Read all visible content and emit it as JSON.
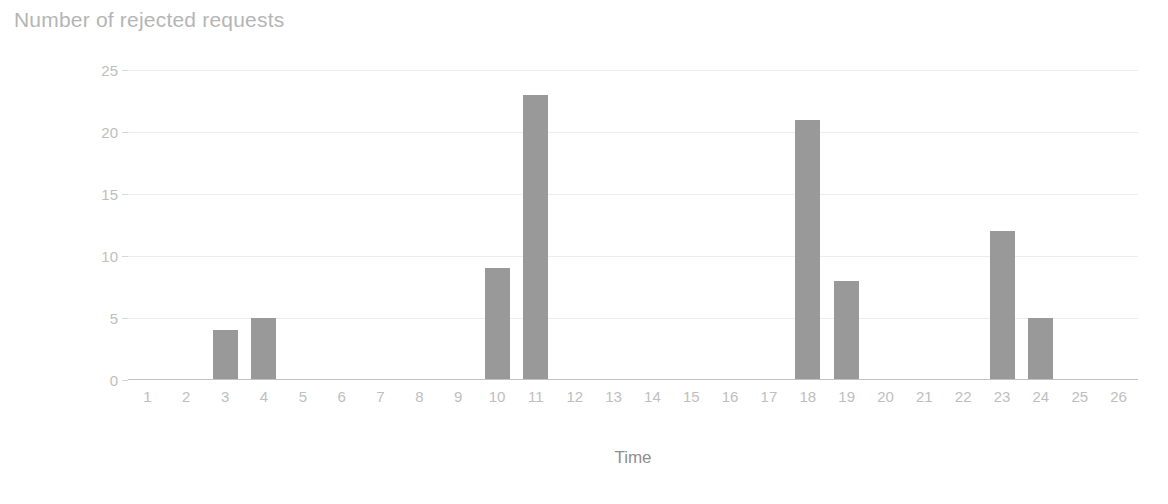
{
  "chart_data": {
    "type": "bar",
    "title": "Number of rejected requests",
    "xlabel": "Time",
    "ylabel": "Number of rejected requests",
    "categories": [
      "1",
      "2",
      "3",
      "4",
      "5",
      "6",
      "7",
      "8",
      "9",
      "10",
      "11",
      "12",
      "13",
      "14",
      "15",
      "16",
      "17",
      "18",
      "19",
      "20",
      "21",
      "22",
      "23",
      "24",
      "25",
      "26"
    ],
    "values": [
      0,
      0,
      4,
      5,
      0,
      0,
      0,
      0,
      0,
      9,
      23,
      0,
      0,
      0,
      0,
      0,
      0,
      21,
      8,
      0,
      0,
      0,
      12,
      5,
      0,
      0
    ],
    "ylim": [
      0,
      25
    ],
    "y_ticks": [
      0,
      5,
      10,
      15,
      20,
      25
    ],
    "y_tick_labels": [
      "0",
      "5",
      "10",
      "15",
      "20",
      "25"
    ],
    "grid": true,
    "legend": "none",
    "series_name": "Number of rejected requests",
    "colors": {
      "bar": "#999999",
      "gridline": "#ededed",
      "axis": "#c2c2c2",
      "title_text": "#b5b5b5",
      "tick_text": "#bebebe",
      "axis_title_text": "#8e8e8e",
      "background": "#ffffff"
    }
  }
}
